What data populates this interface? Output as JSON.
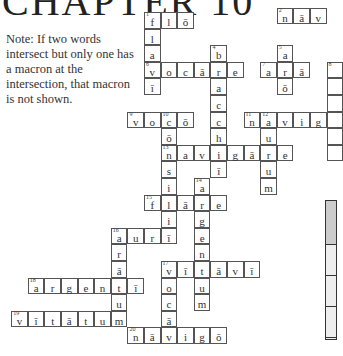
{
  "title": "CHAPTER 10",
  "note": "Note: If two words intersect but only one has a macron at the intersection, that macron is not shown.",
  "grid": {
    "cell_size": 16.6,
    "origin_x": 144,
    "origin_y": 12
  },
  "cells": [
    {
      "c": 0,
      "r": 0,
      "ch": "f",
      "n": "1"
    },
    {
      "c": 1,
      "r": 0,
      "ch": "l"
    },
    {
      "c": 2,
      "r": 0,
      "ch": "ō"
    },
    {
      "c": 0,
      "r": 1,
      "ch": "l"
    },
    {
      "c": 0,
      "r": 2,
      "ch": "a"
    },
    {
      "c": 0,
      "r": 3,
      "ch": "v",
      "n": "6"
    },
    {
      "c": 0,
      "r": 4,
      "ch": "ī"
    },
    {
      "c": 1,
      "r": 3,
      "ch": "o"
    },
    {
      "c": 2,
      "r": 3,
      "ch": "c"
    },
    {
      "c": 3,
      "r": 3,
      "ch": "ā"
    },
    {
      "c": 4,
      "r": 3,
      "ch": "r"
    },
    {
      "c": 5,
      "r": 3,
      "ch": "e"
    },
    {
      "c": 4,
      "r": 2,
      "ch": "b",
      "n": "4"
    },
    {
      "c": 4,
      "r": 4,
      "ch": "a"
    },
    {
      "c": 4,
      "r": 5,
      "ch": "c"
    },
    {
      "c": 4,
      "r": 6,
      "ch": "c"
    },
    {
      "c": 4,
      "r": 7,
      "ch": "h"
    },
    {
      "c": 4,
      "r": 8,
      "ch": "i"
    },
    {
      "c": 4,
      "r": 9,
      "ch": "ī"
    },
    {
      "c": 8,
      "r": -0.25,
      "ch": "n",
      "n": "2"
    },
    {
      "c": 9,
      "r": -0.25,
      "ch": "ā"
    },
    {
      "c": 10,
      "r": -0.25,
      "ch": "v"
    },
    {
      "c": 8,
      "r": 2,
      "ch": "a",
      "n": "5"
    },
    {
      "c": 7,
      "r": 3,
      "ch": "a",
      "n": "7"
    },
    {
      "c": 8,
      "r": 3,
      "ch": "r"
    },
    {
      "c": 9,
      "r": 3,
      "ch": "ā"
    },
    {
      "c": 8,
      "r": 4,
      "ch": "ō"
    },
    {
      "c": -1,
      "r": 6,
      "ch": "v",
      "n": "9"
    },
    {
      "c": 0,
      "r": 6,
      "ch": "o"
    },
    {
      "c": 1,
      "r": 6,
      "ch": "c",
      "n": "10"
    },
    {
      "c": 2,
      "r": 6,
      "ch": "ō"
    },
    {
      "c": 1,
      "r": 7,
      "ch": "ō"
    },
    {
      "c": 1,
      "r": 8,
      "ch": "n",
      "n": "13"
    },
    {
      "c": 1,
      "r": 9,
      "ch": "s"
    },
    {
      "c": 1,
      "r": 10,
      "ch": "i"
    },
    {
      "c": 1,
      "r": 11,
      "ch": "l"
    },
    {
      "c": 1,
      "r": 12,
      "ch": "i"
    },
    {
      "c": 1,
      "r": 13,
      "ch": "ī"
    },
    {
      "c": 6,
      "r": 6,
      "ch": "n",
      "n": "11"
    },
    {
      "c": 7,
      "r": 6,
      "ch": "a",
      "n": "12"
    },
    {
      "c": 8,
      "r": 6,
      "ch": "v"
    },
    {
      "c": 9,
      "r": 6,
      "ch": "i"
    },
    {
      "c": 10,
      "r": 6,
      "ch": "g"
    },
    {
      "c": 7,
      "r": 7,
      "ch": "u"
    },
    {
      "c": 7,
      "r": 8,
      "ch": "r"
    },
    {
      "c": 7,
      "r": 9,
      "ch": "u"
    },
    {
      "c": 7,
      "r": 10,
      "ch": "m"
    },
    {
      "c": 8,
      "r": 8,
      "ch": "e"
    },
    {
      "c": 2,
      "r": 8,
      "ch": "a"
    },
    {
      "c": 3,
      "r": 8,
      "ch": "v"
    },
    {
      "c": 5,
      "r": 8,
      "ch": "g"
    },
    {
      "c": 6,
      "r": 8,
      "ch": "ā"
    },
    {
      "c": 3,
      "r": 10,
      "ch": "a",
      "n": "14"
    },
    {
      "c": 0,
      "r": 11,
      "ch": "f",
      "n": "15"
    },
    {
      "c": 2,
      "r": 11,
      "ch": "ā"
    },
    {
      "c": 3,
      "r": 11,
      "ch": "r"
    },
    {
      "c": 4,
      "r": 11,
      "ch": "e"
    },
    {
      "c": 3,
      "r": 12,
      "ch": "g"
    },
    {
      "c": 3,
      "r": 13,
      "ch": "e"
    },
    {
      "c": 3,
      "r": 14,
      "ch": "n"
    },
    {
      "c": 3,
      "r": 15,
      "ch": "t"
    },
    {
      "c": 3,
      "r": 16,
      "ch": "u"
    },
    {
      "c": 3,
      "r": 17,
      "ch": "m"
    },
    {
      "c": -2,
      "r": 13,
      "ch": "a",
      "n": "16"
    },
    {
      "c": -1,
      "r": 13,
      "ch": "u"
    },
    {
      "c": 0,
      "r": 13,
      "ch": "r"
    },
    {
      "c": -2,
      "r": 14,
      "ch": "r"
    },
    {
      "c": -2,
      "r": 15,
      "ch": "ā"
    },
    {
      "c": -2,
      "r": 17,
      "ch": "u"
    },
    {
      "c": 1,
      "r": 15,
      "ch": "v",
      "n": "17"
    },
    {
      "c": 2,
      "r": 15,
      "ch": "ī"
    },
    {
      "c": 4,
      "r": 15,
      "ch": "ā"
    },
    {
      "c": 5,
      "r": 15,
      "ch": "v"
    },
    {
      "c": 6,
      "r": 15,
      "ch": "ī"
    },
    {
      "c": 1,
      "r": 16,
      "ch": "o"
    },
    {
      "c": 1,
      "r": 17,
      "ch": "c"
    },
    {
      "c": 1,
      "r": 18,
      "ch": "ā"
    },
    {
      "c": -7,
      "r": 16,
      "ch": "a",
      "n": "18"
    },
    {
      "c": -6,
      "r": 16,
      "ch": "r"
    },
    {
      "c": -5,
      "r": 16,
      "ch": "g"
    },
    {
      "c": -4,
      "r": 16,
      "ch": "e"
    },
    {
      "c": -3,
      "r": 16,
      "ch": "n"
    },
    {
      "c": -2,
      "r": 16,
      "ch": "t"
    },
    {
      "c": -1,
      "r": 16,
      "ch": "ī"
    },
    {
      "c": -8,
      "r": 18,
      "ch": "v",
      "n": "19"
    },
    {
      "c": -7,
      "r": 18,
      "ch": "ī"
    },
    {
      "c": -6,
      "r": 18,
      "ch": "t"
    },
    {
      "c": -5,
      "r": 18,
      "ch": "ā"
    },
    {
      "c": -4,
      "r": 18,
      "ch": "t"
    },
    {
      "c": -3,
      "r": 18,
      "ch": "u"
    },
    {
      "c": -2,
      "r": 18,
      "ch": "m"
    },
    {
      "c": -1,
      "r": 19,
      "ch": "n",
      "n": "20"
    },
    {
      "c": 0,
      "r": 19,
      "ch": "ā"
    },
    {
      "c": 1,
      "r": 19,
      "ch": "v"
    },
    {
      "c": 2,
      "r": 19,
      "ch": "i"
    },
    {
      "c": 3,
      "r": 19,
      "ch": "g"
    },
    {
      "c": 4,
      "r": 19,
      "ch": "ō"
    },
    {
      "c": 11,
      "r": 3,
      "ch": "",
      "n": "8"
    },
    {
      "c": 11,
      "r": 4,
      "ch": ""
    },
    {
      "c": 11,
      "r": 5,
      "ch": ""
    },
    {
      "c": 11,
      "r": 6,
      "ch": ""
    },
    {
      "c": 11,
      "r": 7,
      "ch": ""
    },
    {
      "c": 11,
      "r": 8,
      "ch": ""
    }
  ]
}
